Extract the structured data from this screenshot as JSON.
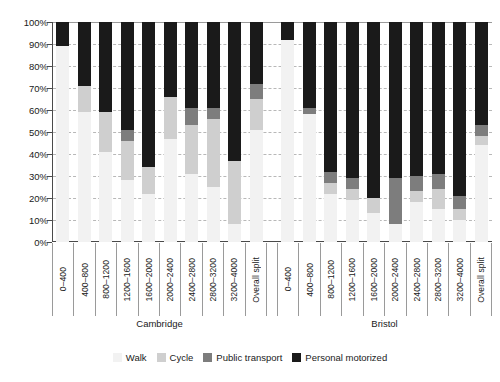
{
  "chart_data": {
    "type": "bar",
    "subtype": "stacked-bar-100-percent",
    "title": "",
    "subtitle": "",
    "xlabel": "",
    "ylabel": "",
    "ylim": [
      0,
      100
    ],
    "grid": true,
    "legend_position": "bottom",
    "y_ticks": [
      "0%",
      "10%",
      "20%",
      "30%",
      "40%",
      "50%",
      "60%",
      "70%",
      "80%",
      "90%",
      "100%"
    ],
    "y_tick_values": [
      0,
      10,
      20,
      30,
      40,
      50,
      60,
      70,
      80,
      90,
      100
    ],
    "categories": [
      "0–400",
      "400–800",
      "800–1200",
      "1200–1600",
      "1600–2000",
      "2000–2400",
      "2400–2800",
      "2800–3200",
      "3200–4000",
      "Overall split"
    ],
    "groups": [
      {
        "name": "Cambridge",
        "categories": [
          "0–400",
          "400–800",
          "800–1200",
          "1200–1600",
          "1600–2000",
          "2000–2400",
          "2400–2800",
          "2800–3200",
          "3200–4000",
          "Overall split"
        ],
        "series": [
          {
            "name": "Walk",
            "values": [
              89,
              59,
              41,
              28,
              22,
              47,
              31,
              25,
              8,
              51
            ]
          },
          {
            "name": "Cycle",
            "values": [
              0,
              12,
              18,
              18,
              12,
              19,
              22,
              31,
              29,
              14
            ]
          },
          {
            "name": "Public transport",
            "values": [
              0,
              0,
              0,
              5,
              0,
              0,
              8,
              5,
              0,
              7
            ]
          },
          {
            "name": "Personal motorized",
            "values": [
              11,
              29,
              41,
              49,
              66,
              34,
              39,
              39,
              63,
              28
            ]
          }
        ]
      },
      {
        "name": "Bristol",
        "categories": [
          "0–400",
          "400–800",
          "800–1200",
          "1200–1600",
          "1600–2000",
          "2000–2400",
          "2400–2800",
          "2800–3200",
          "3200–4000",
          "Overall split"
        ],
        "series": [
          {
            "name": "Walk",
            "values": [
              92,
              58,
              22,
              19,
              13,
              8,
              18,
              15,
              10,
              44
            ]
          },
          {
            "name": "Cycle",
            "values": [
              0,
              0,
              5,
              5,
              7,
              0,
              5,
              9,
              5,
              4
            ]
          },
          {
            "name": "Public transport",
            "values": [
              0,
              3,
              5,
              5,
              0,
              21,
              7,
              7,
              6,
              5
            ]
          },
          {
            "name": "Personal motorized",
            "values": [
              8,
              39,
              68,
              71,
              80,
              71,
              70,
              69,
              79,
              47
            ]
          }
        ]
      }
    ],
    "legend": [
      {
        "label": "Walk",
        "color": "#f2f2f2"
      },
      {
        "label": "Cycle",
        "color": "#cfcfcf"
      },
      {
        "label": "Public transport",
        "color": "#7d7d7d"
      },
      {
        "label": "Personal motorized",
        "color": "#1a1a1a"
      }
    ],
    "colors": {
      "walk": "#f2f2f2",
      "cycle": "#cfcfcf",
      "public_transport": "#7d7d7d",
      "personal_motorized": "#1a1a1a",
      "axis": "#4a4a4a",
      "gridline": "#b8b8b8",
      "background": "#ffffff",
      "text": "#1a1a1a"
    }
  }
}
